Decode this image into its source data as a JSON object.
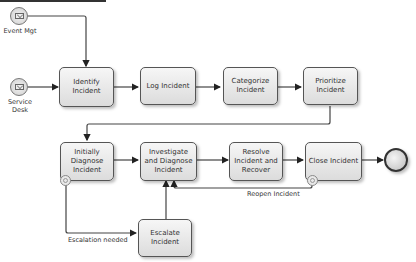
{
  "diagram": {
    "type": "BPMN incident management process",
    "start_events": [
      {
        "id": "event-mgt",
        "label": "Event Mgt",
        "icon": "message-envelope-icon"
      },
      {
        "id": "service-desk",
        "label": "Service\nDesk",
        "label_line1": "Service",
        "label_line2": "Desk",
        "icon": "message-envelope-icon"
      }
    ],
    "tasks": [
      {
        "id": "identify",
        "label": "Identify Incident"
      },
      {
        "id": "log",
        "label": "Log  Incident"
      },
      {
        "id": "categorize",
        "label": "Categorize Incident"
      },
      {
        "id": "prioritize",
        "label": "Prioritize Incident"
      },
      {
        "id": "initial-diagnose",
        "label": "Initially Diagnose Incident"
      },
      {
        "id": "investigate",
        "label": "Investigate and Diagnose Incident"
      },
      {
        "id": "resolve",
        "label": "Resolve Incident and Recover"
      },
      {
        "id": "close",
        "label": "Close Incident"
      },
      {
        "id": "escalate",
        "label": "Escalate Incident"
      }
    ],
    "flow_labels": {
      "escalation": "Escalation needed",
      "reopen": "Reopen Incident"
    },
    "end_event": {
      "id": "end",
      "icon": "end-event-icon"
    }
  }
}
